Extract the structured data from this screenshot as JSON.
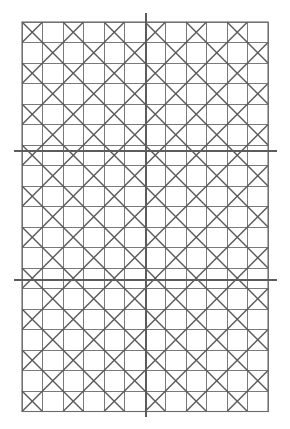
{
  "figure": {
    "canvas": {
      "width": 290,
      "height": 429,
      "background": "#ffffff"
    }
  },
  "chart_data": {
    "type": "diagram",
    "xlabel": "",
    "ylabel": "",
    "grid": {
      "origin_x": 22,
      "origin_y": 22,
      "cell_size": 20.5,
      "columns": 12,
      "rows": 19,
      "right_edge": 268,
      "bottom_edge": 411.5,
      "line_color": "#6b6b6b",
      "line_width": 0.9,
      "border_color": "#6b6b6b",
      "border_width": 1.1
    },
    "motif": {
      "name": "diagonal-quilt-tessellation",
      "rule": "Cells whose (row+column) parity is even carry a full X of both diagonals; cells of odd parity carry no diagonals, so adjacent X cells merge into large rotated squares (diamonds) around each odd cell.",
      "diagonal_color": "#5a5a5a",
      "diagonal_width": 1.4,
      "parity_with_diagonals": "even"
    },
    "axes": [
      {
        "name": "vertical-axis",
        "orientation": "vertical",
        "position": 146,
        "start": 13,
        "end": 417,
        "color": "#5c5c5c",
        "width": 2.6
      },
      {
        "name": "horizontal-axis-upper",
        "orientation": "horizontal",
        "position": 151,
        "start": 14,
        "end": 277,
        "color": "#5c5c5c",
        "width": 2.6
      },
      {
        "name": "horizontal-axis-lower",
        "orientation": "horizontal",
        "position": 280,
        "start": 14,
        "end": 277,
        "color": "#5c5c5c",
        "width": 2.6
      }
    ],
    "colors": {
      "background": "#ffffff",
      "grid_line": "#6b6b6b",
      "diagonal_line": "#5a5a5a",
      "axis_line": "#5c5c5c"
    }
  }
}
